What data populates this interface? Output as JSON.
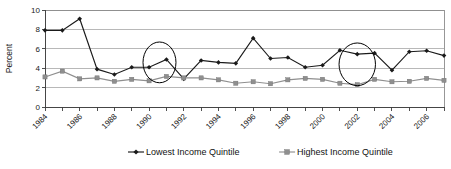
{
  "chart_data": {
    "type": "line",
    "title": "",
    "subtitle": "",
    "xlabel": "",
    "ylabel": "Percent",
    "ylim": [
      0,
      10
    ],
    "ytick_values": [
      0,
      2,
      4,
      6,
      8,
      10
    ],
    "ytick_labels": [
      "0",
      "2",
      "4",
      "6",
      "8",
      "10"
    ],
    "grid": true,
    "legend_position": "bottom",
    "x": [
      1984,
      1985,
      1986,
      1987,
      1988,
      1989,
      1990,
      1991,
      1992,
      1993,
      1994,
      1995,
      1996,
      1997,
      1998,
      1999,
      2000,
      2001,
      2002,
      2003,
      2004,
      2005,
      2006,
      2007
    ],
    "xtick_labels": [
      "1984",
      "",
      "1986",
      "",
      "1988",
      "",
      "1990",
      "",
      "1992",
      "",
      "1994",
      "",
      "1996",
      "",
      "1998",
      "",
      "2000",
      "",
      "2002",
      "",
      "2004",
      "",
      "2006",
      ""
    ],
    "xtick_labels_shown": [
      "1984",
      "1986",
      "1988",
      "1990",
      "1992",
      "1994",
      "1996",
      "1998",
      "2000",
      "2002",
      "2004",
      "2006"
    ],
    "series": [
      {
        "name": "Lowest Income Quintile",
        "color": "#1a1a1a",
        "marker": "diamond",
        "values": [
          7.9,
          7.9,
          9.1,
          3.9,
          3.35,
          4.1,
          4.1,
          4.9,
          2.9,
          4.8,
          4.6,
          4.5,
          7.1,
          5.0,
          5.1,
          4.1,
          4.3,
          5.85,
          5.45,
          5.55,
          3.8,
          5.7,
          5.8,
          5.3
        ]
      },
      {
        "name": "Highest Income Quintile",
        "color": "#8f8f8f",
        "marker": "square",
        "values": [
          3.1,
          3.7,
          2.9,
          3.0,
          2.65,
          2.85,
          2.7,
          3.15,
          3.0,
          3.0,
          2.8,
          2.45,
          2.6,
          2.4,
          2.8,
          2.95,
          2.85,
          2.45,
          2.3,
          2.85,
          2.6,
          2.65,
          2.95,
          2.75
        ]
      }
    ],
    "annotations": [
      {
        "type": "ellipse",
        "label": "highlight-ellipse-1990-1991",
        "center_x": 1990.6,
        "center_y": 4.6,
        "width_years": 1.9,
        "height_value": 4.2
      },
      {
        "type": "ellipse",
        "label": "highlight-ellipse-2001-2003",
        "center_x": 2002.0,
        "center_y": 4.4,
        "width_years": 2.1,
        "height_value": 4.4
      }
    ]
  },
  "legend": {
    "items": [
      {
        "label": "Lowest Income Quintile",
        "marker": "diamond",
        "color": "#1a1a1a"
      },
      {
        "label": "Highest Income Quintile",
        "marker": "square",
        "color": "#8f8f8f"
      }
    ]
  }
}
